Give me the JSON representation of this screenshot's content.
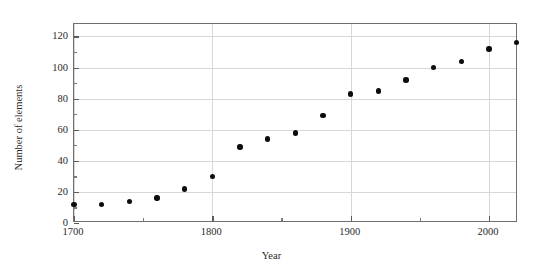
{
  "chart_data": {
    "type": "scatter",
    "title": "Chronology of Elements",
    "xlabel": "Year",
    "ylabel": "Number of elements",
    "xlim": [
      1700,
      2020
    ],
    "ylim": [
      0,
      128
    ],
    "grid": "horizontal",
    "legend": "none",
    "marker": "filled-circle",
    "marker_color": "#0d0d0d",
    "x_ticks": [
      1700,
      1800,
      1900,
      2000
    ],
    "x_tick_labels": [
      "1700",
      "1800",
      "1900",
      "2000"
    ],
    "x_minor_ticks": [
      1750,
      1850,
      1950
    ],
    "y_ticks": [
      0,
      20,
      40,
      60,
      80,
      100,
      120
    ],
    "y_tick_labels": [
      "0",
      "20",
      "40",
      "60",
      "80",
      "100",
      "120"
    ],
    "y_minor_ticks": [
      10,
      30,
      50,
      70,
      90,
      110
    ],
    "x": [
      1700,
      1720,
      1740,
      1760,
      1780,
      1800,
      1820,
      1840,
      1860,
      1880,
      1900,
      1920,
      1940,
      1960,
      1980,
      2000,
      2020
    ],
    "values": [
      12,
      12,
      14,
      16,
      22,
      30,
      49,
      54,
      58,
      69,
      83,
      85,
      92,
      100,
      104,
      112,
      116
    ],
    "points": [
      {
        "x": 1700,
        "y": 12
      },
      {
        "x": 1720,
        "y": 12
      },
      {
        "x": 1740,
        "y": 14
      },
      {
        "x": 1760,
        "y": 16
      },
      {
        "x": 1780,
        "y": 22
      },
      {
        "x": 1800,
        "y": 30
      },
      {
        "x": 1820,
        "y": 49
      },
      {
        "x": 1840,
        "y": 54
      },
      {
        "x": 1860,
        "y": 58
      },
      {
        "x": 1880,
        "y": 69
      },
      {
        "x": 1900,
        "y": 83
      },
      {
        "x": 1920,
        "y": 85
      },
      {
        "x": 1940,
        "y": 92
      },
      {
        "x": 1960,
        "y": 100
      },
      {
        "x": 1980,
        "y": 104
      },
      {
        "x": 2000,
        "y": 112
      },
      {
        "x": 2020,
        "y": 116
      }
    ]
  },
  "colors": {
    "background": "#ffffff",
    "frame": "#6f6f6f",
    "gridline": "#d8d8d8",
    "marker": "#0d0d0d",
    "text": "#1a1a1a"
  }
}
